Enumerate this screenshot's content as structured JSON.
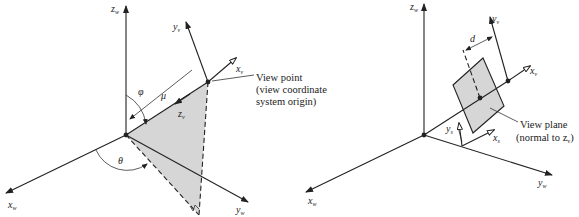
{
  "colors": {
    "ink": "#222222",
    "shade": "#d6d6d6",
    "background": "#ffffff"
  },
  "left_diagram": {
    "axes": {
      "z": "z",
      "z_sub": "w",
      "x": "x",
      "x_sub": "w",
      "y": "y",
      "y_sub": "w"
    },
    "view_axes": {
      "x": "x",
      "x_sub": "v",
      "y": "y",
      "y_sub": "v",
      "z": "z",
      "z_sub": "v"
    },
    "angles": {
      "phi": "φ",
      "theta": "θ",
      "mu": "μ"
    },
    "annotation": {
      "line1": "View point",
      "line2": "(view coordinate",
      "line3": "system origin)"
    }
  },
  "right_diagram": {
    "axes": {
      "z": "z",
      "z_sub": "w",
      "x": "x",
      "x_sub": "w",
      "y": "y",
      "y_sub": "w"
    },
    "view_axes": {
      "x": "x",
      "x_sub": "v",
      "y": "y",
      "y_sub": "v"
    },
    "plane_axes": {
      "x": "x",
      "x_sub": "s",
      "y": "y",
      "y_sub": "s"
    },
    "distance": "d",
    "annotation": {
      "line1": "View plane",
      "line2": "(normal to z",
      "line2_sub": "v",
      "line2_end": ")"
    }
  }
}
